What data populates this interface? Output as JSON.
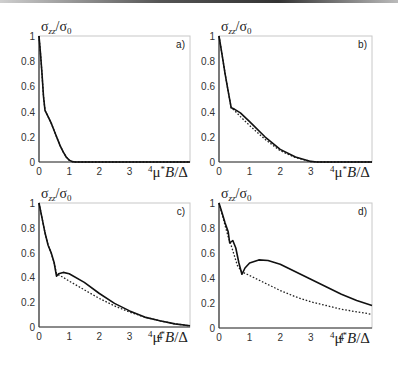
{
  "figure": {
    "panels": [
      {
        "tag": "a)",
        "ylabel": "σzz/σ0",
        "xlabel": "⁴μ*B/Δ"
      },
      {
        "tag": "b)",
        "ylabel": "σzz/σ0",
        "xlabel": "⁴μ*B/Δ"
      },
      {
        "tag": "c)",
        "ylabel": "σzz/σ0",
        "xlabel": "⁴μ*B/Δ"
      },
      {
        "tag": "d)",
        "ylabel": "σzz/σ0",
        "xlabel": "⁴μ*B/Δ"
      }
    ],
    "yticks": [
      "0",
      "0.2",
      "0.4",
      "0.6",
      "0.8",
      "1"
    ],
    "xticks": [
      "0",
      "1",
      "2",
      "3"
    ]
  },
  "chart_data": [
    {
      "type": "line",
      "title": "a)",
      "xlabel": "4 μ* B / Δ",
      "ylabel": "σzz / σ0",
      "xlim": [
        0,
        5
      ],
      "ylim": [
        0,
        1
      ],
      "xticks": [
        0,
        1,
        2,
        3
      ],
      "yticks": [
        0,
        0.2,
        0.4,
        0.6,
        0.8,
        1
      ],
      "grid": false,
      "series": [
        {
          "name": "solid",
          "style": "solid",
          "x": [
            0,
            0.05,
            0.1,
            0.15,
            0.2,
            0.3,
            0.4,
            0.5,
            0.6,
            0.7,
            0.8,
            0.9,
            1.0,
            1.1,
            1.2,
            2,
            3,
            4,
            5
          ],
          "y": [
            1.0,
            0.86,
            0.7,
            0.52,
            0.41,
            0.36,
            0.31,
            0.25,
            0.19,
            0.13,
            0.08,
            0.04,
            0.015,
            0.003,
            0,
            0,
            0,
            0,
            0
          ]
        },
        {
          "name": "dotted",
          "style": "dotted",
          "x": [
            0,
            0.05,
            0.1,
            0.15,
            0.2,
            0.3,
            0.4,
            0.5,
            0.6,
            0.7,
            0.8,
            0.9,
            1.0,
            1.1,
            1.2,
            2,
            3,
            4,
            5
          ],
          "y": [
            1.0,
            0.86,
            0.7,
            0.52,
            0.41,
            0.36,
            0.31,
            0.25,
            0.19,
            0.13,
            0.08,
            0.04,
            0.015,
            0.003,
            0,
            0,
            0,
            0,
            0
          ]
        }
      ]
    },
    {
      "type": "line",
      "title": "b)",
      "xlabel": "4 μ* B / Δ",
      "ylabel": "σzz / σ0",
      "xlim": [
        0,
        5
      ],
      "ylim": [
        0,
        1
      ],
      "xticks": [
        0,
        1,
        2,
        3
      ],
      "yticks": [
        0,
        0.2,
        0.4,
        0.6,
        0.8,
        1
      ],
      "grid": false,
      "series": [
        {
          "name": "solid",
          "style": "solid",
          "x": [
            0,
            0.1,
            0.2,
            0.3,
            0.4,
            0.5,
            0.7,
            1.0,
            1.5,
            2.0,
            2.5,
            3.0,
            3.2,
            4,
            5
          ],
          "y": [
            1.0,
            0.85,
            0.7,
            0.56,
            0.43,
            0.42,
            0.39,
            0.32,
            0.2,
            0.1,
            0.04,
            0.005,
            0,
            0,
            0
          ]
        },
        {
          "name": "dotted",
          "style": "dotted",
          "x": [
            0,
            0.1,
            0.2,
            0.3,
            0.4,
            0.5,
            0.7,
            1.0,
            1.5,
            2.0,
            2.5,
            3.0,
            3.2,
            4,
            5
          ],
          "y": [
            1.0,
            0.85,
            0.7,
            0.56,
            0.43,
            0.41,
            0.36,
            0.29,
            0.18,
            0.09,
            0.035,
            0.004,
            0,
            0,
            0
          ]
        }
      ]
    },
    {
      "type": "line",
      "title": "c)",
      "xlabel": "4 μ* B / Δ",
      "ylabel": "σzz / σ0",
      "xlim": [
        0,
        5
      ],
      "ylim": [
        0,
        1
      ],
      "xticks": [
        0,
        1,
        2,
        3,
        4
      ],
      "yticks": [
        0,
        0.2,
        0.4,
        0.6,
        0.8,
        1
      ],
      "grid": false,
      "series": [
        {
          "name": "solid",
          "style": "solid",
          "x": [
            0,
            0.1,
            0.2,
            0.3,
            0.4,
            0.5,
            0.58,
            0.65,
            0.8,
            1.0,
            1.5,
            2.0,
            2.5,
            3.0,
            3.5,
            4.0,
            4.5,
            5.0
          ],
          "y": [
            1.0,
            0.88,
            0.76,
            0.66,
            0.6,
            0.52,
            0.41,
            0.43,
            0.44,
            0.43,
            0.36,
            0.27,
            0.19,
            0.13,
            0.08,
            0.05,
            0.025,
            0.01
          ]
        },
        {
          "name": "dotted",
          "style": "dotted",
          "x": [
            0,
            0.1,
            0.2,
            0.3,
            0.4,
            0.5,
            0.58,
            0.65,
            0.8,
            1.0,
            1.5,
            2.0,
            2.5,
            3.0,
            3.5,
            4.0,
            4.5,
            5.0
          ],
          "y": [
            1.0,
            0.88,
            0.76,
            0.66,
            0.6,
            0.52,
            0.43,
            0.42,
            0.4,
            0.37,
            0.3,
            0.23,
            0.17,
            0.12,
            0.08,
            0.05,
            0.025,
            0.01
          ]
        }
      ]
    },
    {
      "type": "line",
      "title": "d)",
      "xlabel": "4 μ* B / Δ",
      "ylabel": "σzz / σ0",
      "xlim": [
        0,
        5
      ],
      "ylim": [
        0,
        1
      ],
      "xticks": [
        0,
        1,
        2,
        3,
        4
      ],
      "yticks": [
        0,
        0.2,
        0.4,
        0.6,
        0.8,
        1
      ],
      "grid": false,
      "series": [
        {
          "name": "solid",
          "style": "solid",
          "x": [
            0,
            0.1,
            0.2,
            0.3,
            0.35,
            0.45,
            0.55,
            0.65,
            0.75,
            0.85,
            1.0,
            1.3,
            1.6,
            2.0,
            2.5,
            3.0,
            3.5,
            4.0,
            4.5,
            5.0
          ],
          "y": [
            1.0,
            0.92,
            0.84,
            0.77,
            0.68,
            0.7,
            0.64,
            0.52,
            0.43,
            0.48,
            0.52,
            0.545,
            0.54,
            0.51,
            0.45,
            0.39,
            0.33,
            0.27,
            0.22,
            0.18
          ]
        },
        {
          "name": "dotted",
          "style": "dotted",
          "x": [
            0,
            0.1,
            0.2,
            0.3,
            0.4,
            0.5,
            0.6,
            0.75,
            1.0,
            1.5,
            2.0,
            2.5,
            3.0,
            3.5,
            4.0,
            4.5,
            5.0
          ],
          "y": [
            1.0,
            0.91,
            0.82,
            0.73,
            0.66,
            0.58,
            0.5,
            0.45,
            0.42,
            0.36,
            0.3,
            0.25,
            0.21,
            0.18,
            0.15,
            0.13,
            0.11
          ]
        }
      ]
    }
  ]
}
